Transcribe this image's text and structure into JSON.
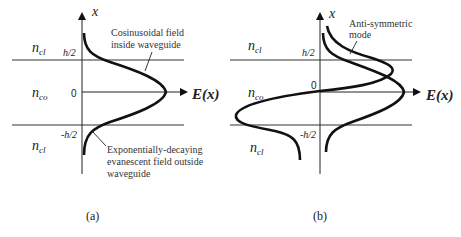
{
  "panels": [
    {
      "id": "a",
      "caption": "(a)",
      "axis_x_label": "x",
      "axis_e_label": "E(x)",
      "tick_top": "h/2",
      "tick_zero": "0",
      "tick_bottom": "-h/2",
      "region_top": {
        "base": "n",
        "sub": "cl"
      },
      "region_mid": {
        "base": "n",
        "sub": "co"
      },
      "region_bot": {
        "base": "n",
        "sub": "cl"
      },
      "annotation_top": [
        "Cosinusoidal field",
        "inside waveguide"
      ],
      "annotation_bottom": [
        "Exponentially-decaying",
        "evanescent field outside",
        "waveguide"
      ]
    },
    {
      "id": "b",
      "caption": "(b)",
      "axis_x_label": "x",
      "axis_e_label": "E(x)",
      "tick_top": "h/2",
      "tick_zero": "0",
      "tick_bottom": "-h/2",
      "region_top": {
        "base": "n",
        "sub": "cl"
      },
      "region_mid": {
        "base": "n",
        "sub": "co"
      },
      "region_bot": {
        "base": "n",
        "sub": "cl"
      },
      "annotation_top": [
        "Anti-symmetric",
        "mode"
      ]
    }
  ]
}
